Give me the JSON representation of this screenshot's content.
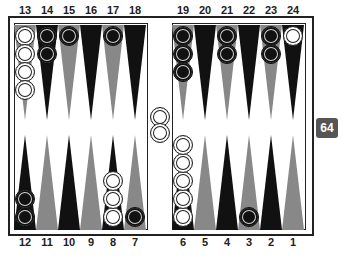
{
  "board": {
    "colors": {
      "frame": "#222222",
      "point_dark": "#111111",
      "point_gray": "#888888",
      "checker_white": "#ffffff",
      "checker_black": "#111111",
      "cube_bg": "#555555"
    },
    "top_labels": [
      "13",
      "14",
      "15",
      "16",
      "17",
      "18",
      "19",
      "20",
      "21",
      "22",
      "23",
      "24"
    ],
    "bottom_labels": [
      "12",
      "11",
      "10",
      "9",
      "8",
      "7",
      "6",
      "5",
      "4",
      "3",
      "2",
      "1"
    ],
    "points": {
      "13": {
        "color": "gray",
        "checkers": "white",
        "count": 4
      },
      "14": {
        "color": "dark",
        "checkers": "black",
        "count": 2
      },
      "15": {
        "color": "gray",
        "checkers": "black",
        "count": 1
      },
      "16": {
        "color": "dark",
        "checkers": "",
        "count": 0
      },
      "17": {
        "color": "gray",
        "checkers": "black",
        "count": 1
      },
      "18": {
        "color": "dark",
        "checkers": "",
        "count": 0
      },
      "19": {
        "color": "gray",
        "checkers": "black",
        "count": 3
      },
      "20": {
        "color": "dark",
        "checkers": "",
        "count": 0
      },
      "21": {
        "color": "gray",
        "checkers": "black",
        "count": 2
      },
      "22": {
        "color": "dark",
        "checkers": "",
        "count": 0
      },
      "23": {
        "color": "gray",
        "checkers": "black",
        "count": 2
      },
      "24": {
        "color": "dark",
        "checkers": "white",
        "count": 1
      },
      "12": {
        "color": "dark",
        "checkers": "black",
        "count": 2
      },
      "11": {
        "color": "gray",
        "checkers": "",
        "count": 0
      },
      "10": {
        "color": "dark",
        "checkers": "",
        "count": 0
      },
      "9": {
        "color": "gray",
        "checkers": "",
        "count": 0
      },
      "8": {
        "color": "dark",
        "checkers": "white",
        "count": 3
      },
      "7": {
        "color": "gray",
        "checkers": "black",
        "count": 1
      },
      "6": {
        "color": "dark",
        "checkers": "white",
        "count": 5
      },
      "5": {
        "color": "gray",
        "checkers": "",
        "count": 0
      },
      "4": {
        "color": "dark",
        "checkers": "",
        "count": 0
      },
      "3": {
        "color": "gray",
        "checkers": "black",
        "count": 1
      },
      "2": {
        "color": "dark",
        "checkers": "",
        "count": 0
      },
      "1": {
        "color": "gray",
        "checkers": "",
        "count": 0
      }
    },
    "bar": {
      "checkers": "white",
      "count": 2
    },
    "doubling_cube": {
      "value": "64"
    }
  }
}
